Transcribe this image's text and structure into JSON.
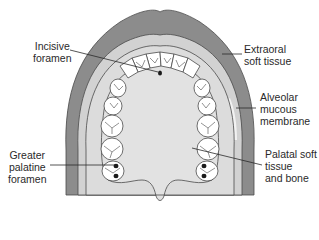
{
  "colors": {
    "extraoral_soft_tissue": "#8c8c8c",
    "alveolar_mucous_membrane": "#d2d2d2",
    "palate": "#dedede",
    "outline": "#4a4a4a",
    "tooth": "#ffffff",
    "text": "#2a2a2a",
    "background": "#ffffff"
  },
  "labels": {
    "incisive_foramen": {
      "lines": [
        "Incisive",
        "foramen"
      ]
    },
    "extraoral_soft_tissue": {
      "lines": [
        "Extraoral",
        "soft tissue"
      ]
    },
    "alveolar_mucous_membrane": {
      "lines": [
        "Alveolar",
        "mucous",
        "membrane"
      ]
    },
    "greater_palatine_foramen": {
      "lines": [
        "Greater",
        "palatine",
        "foramen"
      ]
    },
    "palatal_soft_tissue": {
      "lines": [
        "Palatal soft",
        "tissue",
        "and bone"
      ]
    }
  }
}
